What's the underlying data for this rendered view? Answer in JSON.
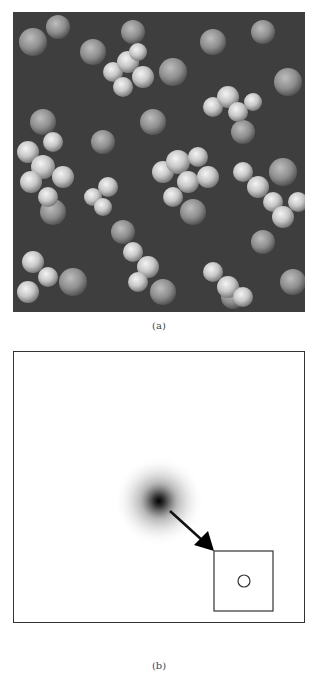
{
  "figure": {
    "panels": [
      {
        "id": "a",
        "caption": "(a)",
        "content": "grayscale micrograph of clustered spherical particles (agglomerates)"
      },
      {
        "id": "b",
        "caption": "(b)",
        "content": "diffuse dark spot with arrow pointing to inset box containing a small circle",
        "elements": {
          "spot": {
            "cx": 145,
            "cy": 149
          },
          "arrow": {
            "from": [
              156,
              159
            ],
            "to": [
              200,
              199
            ]
          },
          "inset_box": {
            "x": 200,
            "y": 199,
            "width": 59,
            "height": 60
          },
          "inset_circle": {
            "cx": 230,
            "cy": 229,
            "r": 6
          }
        }
      }
    ],
    "colors": {
      "border": "#333333",
      "background": "#ffffff",
      "caption_text": "#444444"
    }
  }
}
